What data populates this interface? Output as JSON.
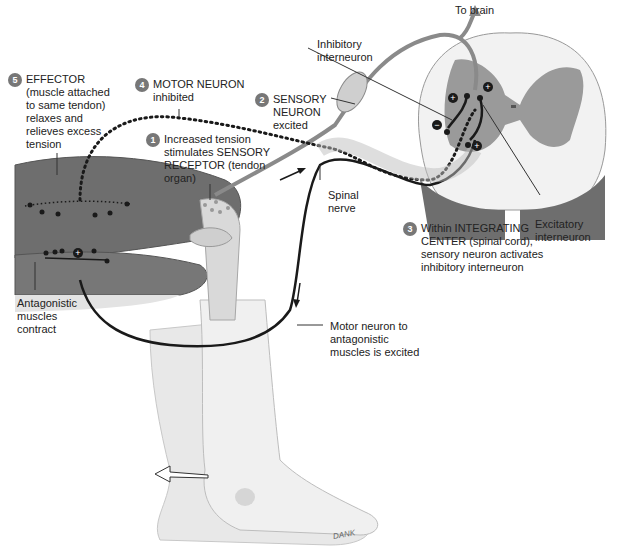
{
  "diagram": {
    "labels": {
      "to_brain": "To brain",
      "inhibitory_interneuron": [
        "Inhibitory",
        "interneuron"
      ],
      "excitatory_interneuron": [
        "Excitatory",
        "interneuron"
      ],
      "spinal_nerve": [
        "Spinal",
        "nerve"
      ],
      "antagonistic_muscles": [
        "Antagonistic",
        "muscles",
        "contract"
      ],
      "motor_neuron_antagonistic": [
        "Motor neuron to",
        "antagonistic",
        "muscles is excited"
      ],
      "signature": "DANK"
    },
    "steps": [
      {
        "number": "1",
        "lines": [
          "Increased tension",
          "stimulates SENSORY",
          "RECEPTOR (tendon",
          "organ)"
        ]
      },
      {
        "number": "2",
        "lines": [
          "SENSORY",
          "NEURON",
          "excited"
        ]
      },
      {
        "number": "3",
        "lines": [
          "Within INTEGRATING",
          "CENTER (spinal cord),",
          "sensory neuron activates",
          "inhibitory  interneuron"
        ]
      },
      {
        "number": "4",
        "lines": [
          "MOTOR NEURON",
          "inhibited"
        ]
      },
      {
        "number": "5",
        "lines": [
          "EFFECTOR",
          "(muscle attached",
          "to same tendon)",
          "relaxes and",
          "relieves excess",
          "tension"
        ]
      }
    ],
    "synapse_signs": {
      "excitatory": "+",
      "inhibitory": "−"
    },
    "colors": {
      "muscle": "#6e6e6e",
      "bone": "#d9d9d9",
      "skin": "#e6e6e6",
      "grey_matter": "#9a9a9a",
      "white_matter": "#f2f2f2",
      "neuron_line": "#1a1a1a",
      "sensory_line": "#8a8a8a",
      "step_badge": "#777777"
    }
  }
}
